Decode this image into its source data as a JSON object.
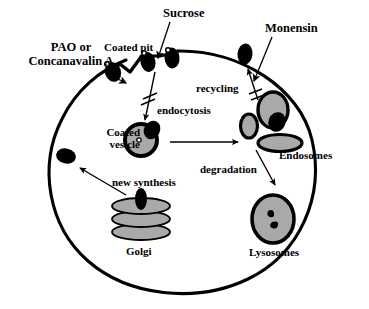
{
  "figure": {
    "type": "biological-cell-diagram",
    "background_color": "#ffffff",
    "stroke_color": "#000000",
    "organelle_fill": "#a9a9a9",
    "width": 369,
    "height": 309
  },
  "inhibitors": [
    {
      "id": "pao-concanavalin",
      "label_line1": "PAO or",
      "label_line2": "Concanavalin A",
      "blocks": "endocytosis"
    },
    {
      "id": "sucrose",
      "label": "Sucrose",
      "blocks": "endocytosis"
    },
    {
      "id": "monensin",
      "label": "Monensin",
      "blocks": "recycling"
    }
  ],
  "structures": [
    {
      "id": "coated-pit",
      "label": "Coated pit"
    },
    {
      "id": "coated-vesicle",
      "label_line1": "Coated",
      "label_line2": "vesicle"
    },
    {
      "id": "endosomes",
      "label": "Endosomes"
    },
    {
      "id": "lysosomes",
      "label": "Lysosomes"
    },
    {
      "id": "golgi",
      "label": "Golgi"
    }
  ],
  "processes": [
    {
      "id": "endocytosis",
      "label": "endocytosis",
      "inhibited": true
    },
    {
      "id": "recycling",
      "label": "recycling",
      "inhibited": true
    },
    {
      "id": "degradation",
      "label": "degradation",
      "inhibited": false
    },
    {
      "id": "new-synthesis",
      "label": "new synthesis",
      "inhibited": false
    }
  ],
  "labels": {
    "pao_line1": "PAO or",
    "pao_line2": "Concanavalin A",
    "sucrose": "Sucrose",
    "monensin": "Monensin",
    "coated_pit": "Coated pit",
    "coated_vesicle_line1": "Coated",
    "coated_vesicle_line2": "vesicle",
    "endocytosis": "endocytosis",
    "recycling": "recycling",
    "degradation": "degradation",
    "new_synthesis": "new synthesis",
    "endosomes": "Endosomes",
    "lysosomes": "Lysosomes",
    "golgi": "Golgi"
  }
}
